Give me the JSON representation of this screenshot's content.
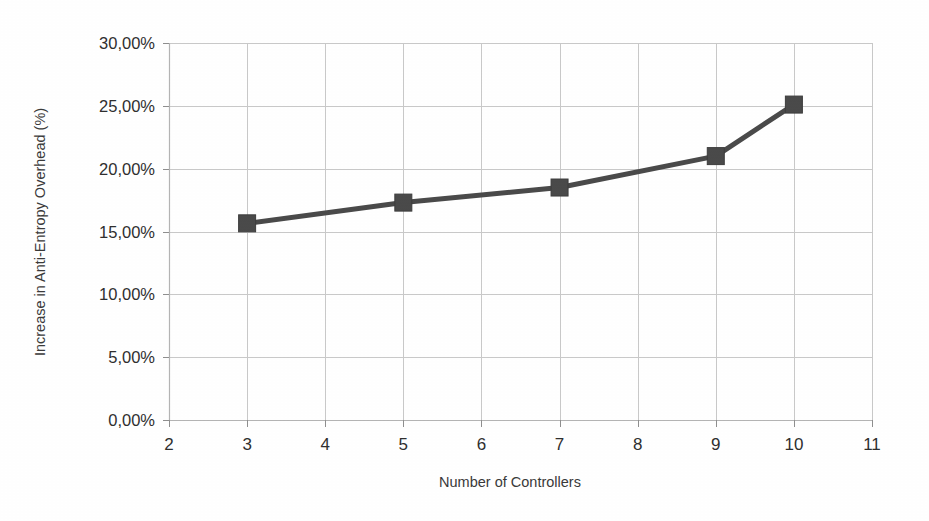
{
  "chart_data": {
    "type": "line",
    "title": "",
    "xlabel": "Number of Controllers",
    "ylabel": "Increase in Anti-Entropy Overhead (%)",
    "xlim": [
      2,
      11
    ],
    "ylim": [
      0,
      30
    ],
    "grid": true,
    "legend": "none",
    "x_ticks": [
      "2",
      "3",
      "4",
      "5",
      "6",
      "7",
      "8",
      "9",
      "10",
      "11"
    ],
    "x_tick_values": [
      2,
      3,
      4,
      5,
      6,
      7,
      8,
      9,
      10,
      11
    ],
    "y_ticks": [
      "0,00%",
      "5,00%",
      "10,00%",
      "15,00%",
      "20,00%",
      "25,00%",
      "30,00%"
    ],
    "y_tick_values": [
      0,
      5,
      10,
      15,
      20,
      25,
      30
    ],
    "x": [
      3,
      5,
      7,
      9,
      10
    ],
    "values": [
      15.65,
      17.3,
      18.5,
      21.0,
      25.1
    ],
    "series": [
      {
        "name": "Increase in Anti-Entropy Overhead",
        "x": [
          3,
          5,
          7,
          9,
          10
        ],
        "values": [
          15.65,
          17.3,
          18.5,
          21.0,
          25.1
        ],
        "marker": "square",
        "color": "#4a4a4a"
      }
    ]
  },
  "style": {
    "line_color": "#4a4a4a",
    "marker_color": "#4a4a4a",
    "grid_color": "#c9c9c9",
    "axis_color": "#b4b4b4",
    "text_color": "#2f2f2f",
    "background": "#ffffff"
  },
  "geometry": {
    "plot_left": 169,
    "plot_right": 872,
    "plot_top": 43,
    "plot_bottom": 420,
    "x_axis_title_x": 510,
    "x_axis_title_y": 487,
    "y_axis_title_x": 45,
    "y_axis_title_y": 232
  }
}
